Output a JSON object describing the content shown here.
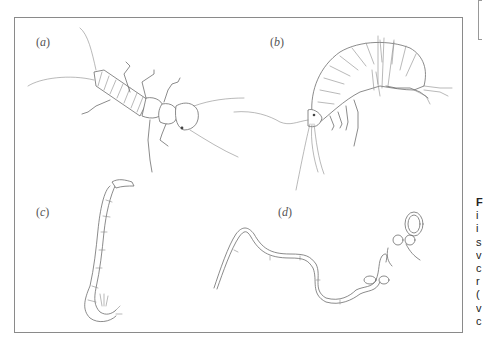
{
  "figure": {
    "panels": [
      {
        "id": "a",
        "label_prefix": "(",
        "label_letter": "a",
        "label_suffix": ")",
        "subject": "stonefly-nymph"
      },
      {
        "id": "b",
        "label_prefix": "(",
        "label_letter": "b",
        "label_suffix": ")",
        "subject": "amphipod"
      },
      {
        "id": "c",
        "label_prefix": "(",
        "label_letter": "c",
        "label_suffix": ")",
        "subject": "chironomid-larva"
      },
      {
        "id": "d",
        "label_prefix": "(",
        "label_letter": "d",
        "label_suffix": ")",
        "subject": "oligochaete-worm"
      }
    ],
    "frame_color": "#8a8a8a",
    "ink_color": "#6d6d6d"
  },
  "side_caption": {
    "clipped_lines": [
      "F",
      "i",
      "i",
      "s",
      "v",
      "c",
      "r",
      "(",
      "v",
      "c"
    ]
  }
}
